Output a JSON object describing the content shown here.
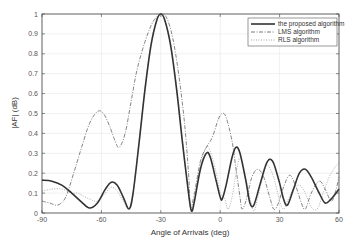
{
  "chart_data": {
    "type": "line",
    "title": "",
    "xlabel": "Angle of Arrivals  (deg)",
    "ylabel": "|AF|  (dB)",
    "xlim": [
      -90,
      60
    ],
    "ylim": [
      0,
      1
    ],
    "xticks": [
      -90,
      -60,
      -30,
      0,
      30,
      60
    ],
    "yticks": [
      0,
      0.1,
      0.2,
      0.3,
      0.4,
      0.5,
      0.6,
      0.7,
      0.8,
      0.9,
      1
    ],
    "grid": true,
    "legend_position": "upper right",
    "series": [
      {
        "name": "the proposed algorithm",
        "style": "solid",
        "color": "#333333",
        "points": [
          [
            -90,
            0.165
          ],
          [
            -85,
            0.16
          ],
          [
            -80,
            0.14
          ],
          [
            -75,
            0.1
          ],
          [
            -70,
            0.055
          ],
          [
            -66,
            0.025
          ],
          [
            -62,
            0.05
          ],
          [
            -58,
            0.12
          ],
          [
            -55,
            0.155
          ],
          [
            -52,
            0.14
          ],
          [
            -49,
            0.08
          ],
          [
            -46,
            0.02
          ],
          [
            -44,
            0.1
          ],
          [
            -41,
            0.35
          ],
          [
            -38,
            0.62
          ],
          [
            -35,
            0.84
          ],
          [
            -32,
            0.97
          ],
          [
            -30,
            1.0
          ],
          [
            -28,
            0.97
          ],
          [
            -25,
            0.84
          ],
          [
            -22,
            0.62
          ],
          [
            -19,
            0.35
          ],
          [
            -16,
            0.1
          ],
          [
            -14.5,
            0.01
          ],
          [
            -13,
            0.06
          ],
          [
            -10,
            0.22
          ],
          [
            -7,
            0.3
          ],
          [
            -5,
            0.28
          ],
          [
            -2,
            0.16
          ],
          [
            0,
            0.08
          ],
          [
            1,
            0.07
          ],
          [
            3,
            0.14
          ],
          [
            6,
            0.28
          ],
          [
            8,
            0.33
          ],
          [
            10,
            0.3
          ],
          [
            13,
            0.16
          ],
          [
            15,
            0.05
          ],
          [
            17,
            0.04
          ],
          [
            20,
            0.14
          ],
          [
            23,
            0.24
          ],
          [
            25,
            0.27
          ],
          [
            27,
            0.25
          ],
          [
            30,
            0.15
          ],
          [
            32,
            0.07
          ],
          [
            34,
            0.04
          ],
          [
            37,
            0.12
          ],
          [
            40,
            0.2
          ],
          [
            43,
            0.22
          ],
          [
            46,
            0.18
          ],
          [
            50,
            0.1
          ],
          [
            53,
            0.05
          ],
          [
            56,
            0.07
          ],
          [
            60,
            0.12
          ]
        ]
      },
      {
        "name": "LMS algorithm",
        "style": "dashdot",
        "color": "#666666",
        "points": [
          [
            -90,
            0.06
          ],
          [
            -86,
            0.05
          ],
          [
            -82,
            0.04
          ],
          [
            -78,
            0.08
          ],
          [
            -74,
            0.2
          ],
          [
            -70,
            0.33
          ],
          [
            -66,
            0.45
          ],
          [
            -62,
            0.51
          ],
          [
            -59,
            0.5
          ],
          [
            -56,
            0.44
          ],
          [
            -53,
            0.36
          ],
          [
            -51,
            0.33
          ],
          [
            -48,
            0.4
          ],
          [
            -45,
            0.56
          ],
          [
            -42,
            0.72
          ],
          [
            -38,
            0.86
          ],
          [
            -34,
            0.96
          ],
          [
            -30,
            1.0
          ],
          [
            -27,
            0.98
          ],
          [
            -24,
            0.88
          ],
          [
            -21,
            0.7
          ],
          [
            -18,
            0.45
          ],
          [
            -16,
            0.2
          ],
          [
            -15,
            0.03
          ],
          [
            -13,
            0.1
          ],
          [
            -10,
            0.26
          ],
          [
            -7,
            0.33
          ],
          [
            -4,
            0.38
          ],
          [
            -1,
            0.47
          ],
          [
            1,
            0.5
          ],
          [
            3,
            0.48
          ],
          [
            6,
            0.36
          ],
          [
            8,
            0.22
          ],
          [
            10,
            0.08
          ],
          [
            11,
            0.02
          ],
          [
            13,
            0.06
          ],
          [
            16,
            0.18
          ],
          [
            19,
            0.22
          ],
          [
            22,
            0.18
          ],
          [
            25,
            0.08
          ],
          [
            27,
            0.02
          ],
          [
            29,
            0.04
          ],
          [
            32,
            0.13
          ],
          [
            35,
            0.19
          ],
          [
            38,
            0.14
          ],
          [
            41,
            0.05
          ],
          [
            43,
            0.02
          ],
          [
            46,
            0.1
          ],
          [
            50,
            0.16
          ],
          [
            53,
            0.12
          ],
          [
            56,
            0.06
          ],
          [
            58,
            0.1
          ],
          [
            60,
            0.18
          ]
        ]
      },
      {
        "name": "RLS algorithm",
        "style": "dotted",
        "color": "#999999",
        "points": [
          [
            -90,
            0.11
          ],
          [
            -85,
            0.12
          ],
          [
            -80,
            0.12
          ],
          [
            -75,
            0.1
          ],
          [
            -72,
            0.1
          ],
          [
            -70,
            0.09
          ],
          [
            -66,
            0.07
          ],
          [
            -62,
            0.06
          ],
          [
            -58,
            0.1
          ],
          [
            -55,
            0.13
          ],
          [
            -52,
            0.11
          ],
          [
            -49,
            0.06
          ],
          [
            -46,
            0.02
          ],
          [
            -44,
            0.1
          ],
          [
            -41,
            0.36
          ],
          [
            -38,
            0.63
          ],
          [
            -35,
            0.85
          ],
          [
            -32,
            0.97
          ],
          [
            -30,
            1.0
          ],
          [
            -28,
            0.97
          ],
          [
            -25,
            0.85
          ],
          [
            -22,
            0.63
          ],
          [
            -19,
            0.36
          ],
          [
            -16,
            0.1
          ],
          [
            -14.5,
            0.01
          ],
          [
            -13,
            0.07
          ],
          [
            -10,
            0.24
          ],
          [
            -7,
            0.33
          ],
          [
            -5,
            0.31
          ],
          [
            -2,
            0.2
          ],
          [
            0,
            0.1
          ],
          [
            2,
            0.08
          ],
          [
            4,
            0.02
          ],
          [
            6,
            0.08
          ],
          [
            8,
            0.2
          ],
          [
            10,
            0.28
          ],
          [
            12,
            0.22
          ],
          [
            15,
            0.08
          ],
          [
            17,
            0.01
          ],
          [
            19,
            0.08
          ],
          [
            22,
            0.2
          ],
          [
            24,
            0.24
          ],
          [
            27,
            0.18
          ],
          [
            30,
            0.06
          ],
          [
            32,
            0.02
          ],
          [
            34,
            0.06
          ],
          [
            37,
            0.12
          ],
          [
            40,
            0.14
          ],
          [
            43,
            0.1
          ],
          [
            46,
            0.03
          ],
          [
            49,
            0.02
          ],
          [
            52,
            0.1
          ],
          [
            55,
            0.18
          ],
          [
            58,
            0.23
          ],
          [
            60,
            0.25
          ]
        ]
      }
    ]
  },
  "legend": {
    "items": [
      {
        "label": "the proposed algorithm"
      },
      {
        "label": "LMS algorithm"
      },
      {
        "label": "RLS algorithm"
      }
    ]
  }
}
